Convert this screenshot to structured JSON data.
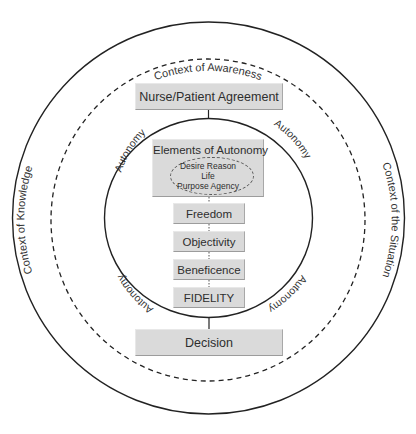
{
  "diagram": {
    "outer_ring": {
      "top_label": "Context of Awareness",
      "left_label": "Context of Knowledge",
      "right_label": "Context of the Situation"
    },
    "inner_ring": {
      "arc_labels": [
        "Autonomy",
        "Autonomy",
        "Autonomy",
        "Autonomy"
      ]
    },
    "top_box": {
      "label": "Nurse/Patient Agreement"
    },
    "elements_box": {
      "title": "Elements of Autonomy",
      "elements": {
        "line1": "Desire  Reason",
        "line2": "Life",
        "line3": "Purpose  Agency"
      }
    },
    "principles": [
      {
        "label": "Freedom"
      },
      {
        "label": "Objectivity"
      },
      {
        "label": "Beneficence"
      },
      {
        "label": "FIDELITY"
      }
    ],
    "bottom_box": {
      "label": "Decision"
    },
    "colors": {
      "box_fill": "#dadada",
      "line": "#222222",
      "text": "#333333"
    }
  }
}
